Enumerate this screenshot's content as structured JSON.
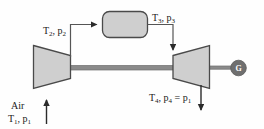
{
  "diagram": {
    "components": {
      "compressor": {
        "name": "compressor",
        "shape": "trapezoid-narrowing-right"
      },
      "heat_exchanger": {
        "name": "heat-exchanger",
        "shape": "rounded-rectangle"
      },
      "turbine": {
        "name": "turbine",
        "shape": "trapezoid-widening-right"
      },
      "generator": {
        "name": "generator",
        "letter": "G"
      },
      "shaft": {
        "name": "shaft"
      }
    },
    "labels": {
      "inlet_fluid": "Air",
      "state1": {
        "T": "T",
        "Tsub": "1",
        "p": "p",
        "psub": "1",
        "text": "T1, p1"
      },
      "state2": {
        "T": "T",
        "Tsub": "2",
        "p": "p",
        "psub": "2",
        "text": "T2, p2"
      },
      "state3": {
        "T": "T",
        "Tsub": "3",
        "p": "p",
        "psub": "3",
        "text": "T3, p3"
      },
      "state4": {
        "T": "T",
        "Tsub": "4",
        "p": "p",
        "psub": "4",
        "eq": "=",
        "p_eq": "p",
        "p_eq_sub": "1",
        "text": "T4, p4 = p1"
      }
    },
    "colors": {
      "fill": "#cfcfcf",
      "stroke": "#4a4a4a",
      "shaft": "#8a8a8a",
      "generator_fill": "#6f6f6f",
      "generator_text": "#ffffff",
      "line": "#555555",
      "background": "#fefefe",
      "text": "#1a1a1a"
    }
  }
}
